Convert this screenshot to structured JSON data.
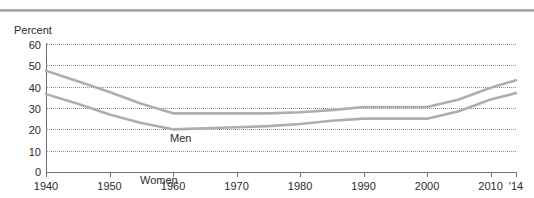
{
  "figure": {
    "y_axis_title": "Percent"
  },
  "chart_data": {
    "type": "line",
    "title": "",
    "xlabel": "",
    "ylabel": "Percent",
    "xlim": [
      1940,
      2014
    ],
    "ylim": [
      0,
      60
    ],
    "grid": true,
    "legend_position": "inline-annotation",
    "x_tick_labels": [
      "1940",
      "1950",
      "1960",
      "1970",
      "1980",
      "1990",
      "2000",
      "2010",
      "'14"
    ],
    "x_tick_values": [
      1940,
      1950,
      1960,
      1970,
      1980,
      1990,
      2000,
      2010,
      2014
    ],
    "y_tick_labels": [
      "0",
      "10",
      "20",
      "30",
      "40",
      "50",
      "60"
    ],
    "y_tick_values": [
      0,
      10,
      20,
      30,
      40,
      50,
      60
    ],
    "x": [
      1940,
      1945,
      1950,
      1955,
      1960,
      1965,
      1970,
      1975,
      1980,
      1985,
      1990,
      1995,
      2000,
      2005,
      2010,
      2014
    ],
    "series": [
      {
        "name": "Men",
        "label": "Men",
        "color": "#aeaeae",
        "values": [
          47.5,
          42.5,
          37.5,
          32.0,
          27.5,
          27.5,
          27.5,
          27.5,
          28.0,
          29.0,
          30.5,
          30.5,
          30.5,
          34.0,
          39.5,
          43.0
        ]
      },
      {
        "name": "Women",
        "label": "Women",
        "color": "#aeaeae",
        "values": [
          36.5,
          32.0,
          27.0,
          23.0,
          20.0,
          20.5,
          21.0,
          21.5,
          22.5,
          24.0,
          25.0,
          25.0,
          25.0,
          28.5,
          34.0,
          37.0
        ]
      }
    ]
  }
}
